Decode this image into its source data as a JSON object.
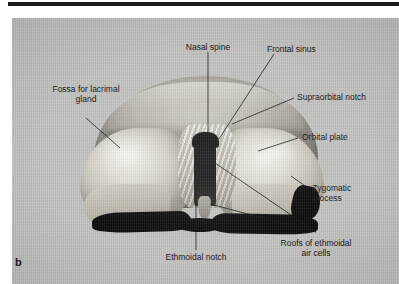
{
  "figure": {
    "part_letter": "b",
    "background_color": "#c3c4c2",
    "rule_color": "#1c1c1c",
    "text_color": "#121212"
  },
  "labels": [
    {
      "id": "nasal-spine",
      "text": "Nasal spine",
      "text2": ""
    },
    {
      "id": "frontal-sinus",
      "text": "Frontal sinus",
      "text2": ""
    },
    {
      "id": "supraorbital-notch",
      "text": "Supraorbital notch",
      "text2": ""
    },
    {
      "id": "orbital-plate",
      "text": "Orbital plate",
      "text2": ""
    },
    {
      "id": "zygomatic-process",
      "text": "Zygomatic",
      "text2": "process"
    },
    {
      "id": "roofs-ethmoidal",
      "text": "Roofs of ethmoidal",
      "text2": "air cells"
    },
    {
      "id": "ethmoidal-notch",
      "text": "Ethmoidal notch",
      "text2": ""
    },
    {
      "id": "fossa-lacrimal-gland",
      "text": "Fossa for lacrimal",
      "text2": "gland"
    }
  ]
}
